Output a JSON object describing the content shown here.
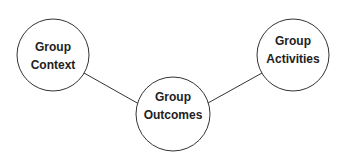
{
  "diagram": {
    "nodes": [
      {
        "id": "context",
        "lines": [
          "Group",
          "Context"
        ],
        "cx": 53,
        "cy": 55,
        "r": 36
      },
      {
        "id": "outcomes",
        "lines": [
          "Group",
          "Outcomes"
        ],
        "cx": 173,
        "cy": 114,
        "r": 37
      },
      {
        "id": "activities",
        "lines": [
          "Group",
          "Activities"
        ],
        "cx": 293,
        "cy": 55,
        "r": 36
      }
    ],
    "edges": [
      {
        "from": "context",
        "to": "outcomes"
      },
      {
        "from": "activities",
        "to": "outcomes"
      }
    ],
    "colors": {
      "stroke": "#333333",
      "text": "#222222",
      "background": "#ffffff"
    }
  }
}
